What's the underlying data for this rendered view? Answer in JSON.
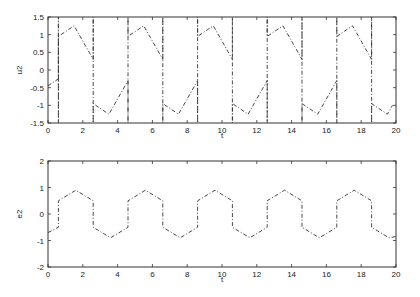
{
  "chart_data": [
    {
      "type": "line",
      "title": "",
      "xlabel": "t",
      "ylabel": "u2",
      "xlim": [
        0,
        20
      ],
      "ylim": [
        -1.5,
        1.5
      ],
      "xticks": [
        "0",
        "2",
        "4",
        "6",
        "8",
        "10",
        "12",
        "14",
        "16",
        "18",
        "20"
      ],
      "yticks": [
        "-1.5",
        "-1",
        "-0.5",
        "0",
        "0.5",
        "1",
        "1.5"
      ],
      "grid": false,
      "line_style": "dash-dot",
      "series": [
        {
          "name": "u2",
          "x": [
            0,
            0.6,
            0.6,
            0.6,
            0.6,
            1.5,
            2.6,
            2.6,
            2.6,
            2.6,
            3.5,
            4.6,
            4.6,
            4.6,
            4.6,
            5.5,
            6.6,
            6.6,
            6.6,
            6.6,
            7.5,
            8.6,
            8.6,
            8.6,
            8.6,
            9.5,
            10.6,
            10.6,
            10.6,
            10.6,
            11.5,
            12.6,
            12.6,
            12.6,
            12.6,
            13.5,
            14.6,
            14.6,
            14.6,
            14.6,
            15.5,
            16.6,
            16.6,
            16.6,
            16.6,
            17.5,
            18.6,
            18.6,
            18.6,
            18.6,
            19.5,
            19.8
          ],
          "y": [
            -0.45,
            -0.25,
            1.5,
            -1.5,
            0.95,
            1.25,
            0.3,
            1.5,
            -1.5,
            -0.95,
            -1.25,
            -0.3,
            -1.5,
            1.5,
            0.95,
            1.25,
            0.3,
            1.5,
            -1.5,
            -0.95,
            -1.25,
            -0.3,
            -1.5,
            1.5,
            0.95,
            1.25,
            0.3,
            1.5,
            -1.5,
            -0.95,
            -1.25,
            -0.3,
            -1.5,
            1.5,
            0.95,
            1.25,
            0.3,
            1.5,
            -1.5,
            -0.95,
            -1.25,
            -0.3,
            -1.5,
            1.5,
            0.95,
            1.25,
            0.3,
            1.5,
            -1.5,
            -0.95,
            -1.25,
            -1.0
          ]
        }
      ]
    },
    {
      "type": "line",
      "title": "",
      "xlabel": "t",
      "ylabel": "e2",
      "xlim": [
        0,
        20
      ],
      "ylim": [
        -2,
        2
      ],
      "xticks": [
        "0",
        "2",
        "4",
        "6",
        "8",
        "10",
        "12",
        "14",
        "16",
        "18",
        "20"
      ],
      "yticks": [
        "-2",
        "-1",
        "0",
        "1",
        "2"
      ],
      "grid": false,
      "line_style": "dash-dot",
      "series": [
        {
          "name": "e2",
          "x": [
            0,
            0.6,
            0.6,
            1.6,
            2.6,
            2.6,
            3.6,
            4.6,
            4.6,
            5.6,
            6.6,
            6.6,
            7.6,
            8.6,
            8.6,
            9.6,
            10.6,
            10.6,
            11.6,
            12.6,
            12.6,
            13.6,
            14.6,
            14.6,
            15.6,
            16.6,
            16.6,
            17.6,
            18.6,
            18.6,
            19.6,
            20
          ],
          "y": [
            -0.7,
            -0.5,
            0.5,
            0.9,
            0.5,
            -0.5,
            -0.9,
            -0.5,
            0.5,
            0.9,
            0.5,
            -0.5,
            -0.9,
            -0.5,
            0.5,
            0.9,
            0.5,
            -0.5,
            -0.9,
            -0.5,
            0.5,
            0.9,
            0.5,
            -0.5,
            -0.9,
            -0.5,
            0.5,
            0.9,
            0.5,
            -0.5,
            -0.9,
            -0.85
          ]
        }
      ]
    }
  ]
}
